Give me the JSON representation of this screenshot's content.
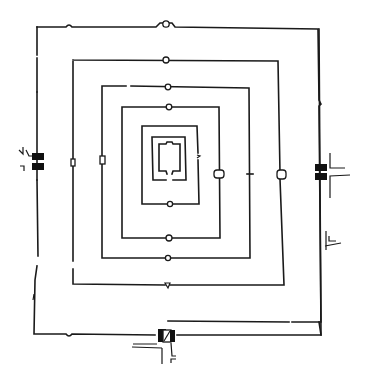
{
  "diagram": {
    "type": "architectural-plan",
    "colors": {
      "line": "#1a1a1a",
      "background": "#ffffff"
    },
    "enclosures": [
      {
        "name": "outer-wall",
        "x1": 37,
        "y1": 27,
        "x2": 142,
        "y2": 148
      },
      {
        "name": "wall-2",
        "x1": 73,
        "y1": 60,
        "x2": 97,
        "y2": 95
      },
      {
        "name": "wall-3",
        "x1": 102,
        "y1": 86,
        "x2": 67,
        "y2": 68
      },
      {
        "name": "wall-4",
        "x1": 122,
        "y1": 107,
        "x2": 36,
        "y2": 47
      },
      {
        "name": "wall-5",
        "x1": 142,
        "y1": 126,
        "x2": 14,
        "y2": 14
      },
      {
        "name": "inner-sanctum",
        "x1": 152,
        "y1": 137,
        "x2": 187,
        "y2": 180
      },
      {
        "name": "core",
        "x1": 158,
        "y1": 143,
        "x2": 181,
        "y2": 172
      }
    ],
    "gates": [
      {
        "name": "west-gate",
        "x": 38,
        "y": 163
      },
      {
        "name": "east-gate",
        "x": 321,
        "y": 170
      },
      {
        "name": "south-gate",
        "x": 167,
        "y": 337
      },
      {
        "name": "east-side-gate",
        "x": 327,
        "y": 243
      }
    ]
  }
}
